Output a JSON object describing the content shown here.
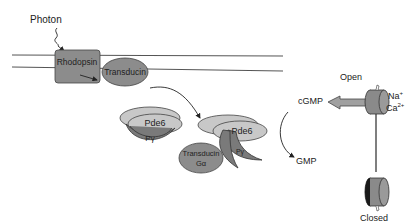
{
  "diagram": {
    "labels": {
      "photon": "Photon",
      "rhodopsin": "Rhodopsin",
      "transducin": "Transducin",
      "pde6_left": "Pde6",
      "pgamma_left": "Pγ",
      "pde6_right": "Pde6",
      "pgamma_right": "Pγ",
      "transducin_ga_line1": "Transducin",
      "transducin_ga_line2": "Gα",
      "cgmp": "cGMP",
      "gmp": "GMP",
      "open": "Open",
      "closed": "Closed",
      "na": "Na",
      "na_sup": "+",
      "ca": "Ca",
      "ca_sup": "2+"
    },
    "colors": {
      "membrane": "#555555",
      "protein_fill": "#8c8c8c",
      "pde_fill": "#c8c8c8",
      "pgamma_fill": "#7a7a7a",
      "channel_fill": "#8a8a8a",
      "channel_dark": "#1a1a1a"
    }
  }
}
